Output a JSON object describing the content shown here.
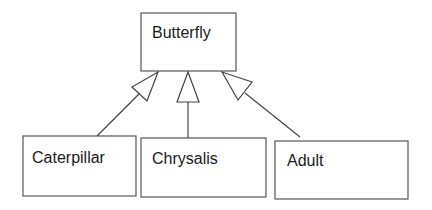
{
  "diagram": {
    "type": "UML class inheritance",
    "parent": {
      "label": "Butterfly"
    },
    "children": [
      {
        "label": "Caterpillar"
      },
      {
        "label": "Chrysalis"
      },
      {
        "label": "Adult"
      }
    ],
    "relationship": "generalization (hollow triangle arrowheads)"
  }
}
